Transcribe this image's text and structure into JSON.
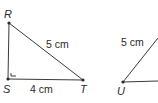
{
  "diagram": {
    "triangle_rst": {
      "vertices": {
        "R": {
          "label": "R",
          "x": 9,
          "y": 23
        },
        "S": {
          "label": "S",
          "x": 8,
          "y": 79
        },
        "T": {
          "label": "T",
          "x": 83,
          "y": 80
        }
      },
      "right_angle_at": "S",
      "sides": {
        "RT": {
          "label": "5 cm"
        },
        "ST": {
          "label": "4 cm"
        }
      }
    },
    "triangle_u": {
      "vertices": {
        "U": {
          "label": "U",
          "x": 123,
          "y": 82
        }
      },
      "sides": {
        "U_upper": {
          "label": "5 cm"
        }
      }
    }
  }
}
